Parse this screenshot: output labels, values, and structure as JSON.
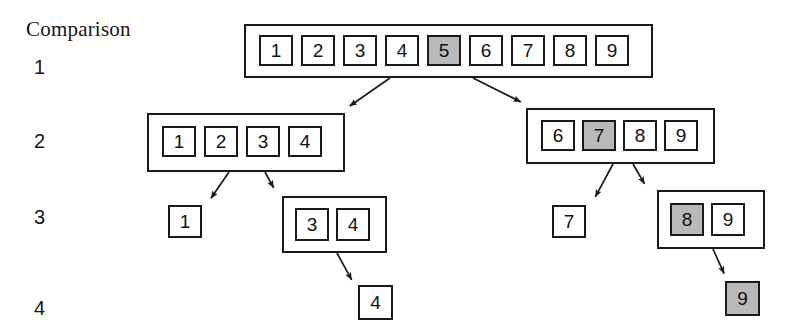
{
  "diagram": {
    "title": "Comparison",
    "kind": "binary-search-recursion-tree",
    "highlight_color": "#b9b9b9",
    "line_color": "#1a1a1a",
    "background_color": "#ffffff",
    "row_labels": [
      {
        "text": "1",
        "x": 34,
        "y": 56
      },
      {
        "text": "2",
        "x": 34,
        "y": 130
      },
      {
        "text": "3",
        "x": 34,
        "y": 206
      },
      {
        "text": "4",
        "x": 34,
        "y": 297
      }
    ],
    "groups": [
      {
        "id": "root",
        "comparison": 1,
        "boxed": true,
        "box": {
          "x": 244,
          "y": 24,
          "w": 409,
          "h": 54
        },
        "cell_size": {
          "w": 34,
          "h": 31
        },
        "cell_gap": 8,
        "cells_origin": {
          "x": 259,
          "y": 35
        },
        "cells": [
          {
            "value": "1",
            "highlighted": false
          },
          {
            "value": "2",
            "highlighted": false
          },
          {
            "value": "3",
            "highlighted": false
          },
          {
            "value": "4",
            "highlighted": false
          },
          {
            "value": "5",
            "highlighted": true
          },
          {
            "value": "6",
            "highlighted": false
          },
          {
            "value": "7",
            "highlighted": false
          },
          {
            "value": "8",
            "highlighted": false
          },
          {
            "value": "9",
            "highlighted": false
          }
        ]
      },
      {
        "id": "left-2",
        "comparison": 2,
        "boxed": true,
        "box": {
          "x": 147,
          "y": 113,
          "w": 198,
          "h": 59
        },
        "cell_size": {
          "w": 34,
          "h": 31
        },
        "cell_gap": 8,
        "cells_origin": {
          "x": 162,
          "y": 126
        },
        "cells": [
          {
            "value": "1",
            "highlighted": false
          },
          {
            "value": "2",
            "highlighted": false
          },
          {
            "value": "3",
            "highlighted": false
          },
          {
            "value": "4",
            "highlighted": false
          }
        ]
      },
      {
        "id": "right-2",
        "comparison": 2,
        "boxed": true,
        "box": {
          "x": 526,
          "y": 108,
          "w": 189,
          "h": 56
        },
        "cell_size": {
          "w": 34,
          "h": 31
        },
        "cell_gap": 7,
        "cells_origin": {
          "x": 541,
          "y": 120
        },
        "cells": [
          {
            "value": "6",
            "highlighted": false
          },
          {
            "value": "7",
            "highlighted": true
          },
          {
            "value": "8",
            "highlighted": false
          },
          {
            "value": "9",
            "highlighted": false
          }
        ]
      },
      {
        "id": "left-3-a",
        "comparison": 3,
        "boxed": false,
        "cell_size": {
          "w": 34,
          "h": 33
        },
        "cell_gap": 8,
        "cells_origin": {
          "x": 168,
          "y": 205
        },
        "cells": [
          {
            "value": "1",
            "highlighted": false
          }
        ]
      },
      {
        "id": "left-3-b",
        "comparison": 3,
        "boxed": true,
        "box": {
          "x": 282,
          "y": 196,
          "w": 105,
          "h": 57
        },
        "cell_size": {
          "w": 34,
          "h": 33
        },
        "cell_gap": 7,
        "cells_origin": {
          "x": 295,
          "y": 208
        },
        "cells": [
          {
            "value": "3",
            "highlighted": false
          },
          {
            "value": "4",
            "highlighted": false
          }
        ]
      },
      {
        "id": "right-3-a",
        "comparison": 3,
        "boxed": false,
        "cell_size": {
          "w": 34,
          "h": 33
        },
        "cell_gap": 8,
        "cells_origin": {
          "x": 552,
          "y": 205
        },
        "cells": [
          {
            "value": "7",
            "highlighted": false
          }
        ]
      },
      {
        "id": "right-3-b",
        "comparison": 3,
        "boxed": true,
        "box": {
          "x": 657,
          "y": 190,
          "w": 108,
          "h": 59
        },
        "cell_size": {
          "w": 34,
          "h": 33
        },
        "cell_gap": 7,
        "cells_origin": {
          "x": 670,
          "y": 203
        },
        "cells": [
          {
            "value": "8",
            "highlighted": true
          },
          {
            "value": "9",
            "highlighted": false
          }
        ]
      },
      {
        "id": "left-4",
        "comparison": 4,
        "boxed": false,
        "cell_size": {
          "w": 35,
          "h": 35
        },
        "cell_gap": 8,
        "cells_origin": {
          "x": 358,
          "y": 285
        },
        "cells": [
          {
            "value": "4",
            "highlighted": false
          }
        ]
      },
      {
        "id": "right-4",
        "comparison": 4,
        "boxed": false,
        "cell_size": {
          "w": 35,
          "h": 35
        },
        "cell_gap": 8,
        "cells_origin": {
          "x": 725,
          "y": 281
        },
        "cells": [
          {
            "value": "9",
            "highlighted": true
          }
        ]
      }
    ],
    "arrows": [
      {
        "id": "root-to-left2",
        "x1": 390,
        "y1": 78,
        "x2": 344,
        "y2": 110
      },
      {
        "id": "root-to-right2",
        "x1": 473,
        "y1": 78,
        "x2": 527,
        "y2": 105
      },
      {
        "id": "left2-to-1",
        "x1": 229,
        "y1": 172,
        "x2": 207,
        "y2": 204
      },
      {
        "id": "left2-to-34",
        "x1": 265,
        "y1": 172,
        "x2": 277,
        "y2": 194
      },
      {
        "id": "right2-to-7",
        "x1": 613,
        "y1": 164,
        "x2": 592,
        "y2": 203
      },
      {
        "id": "right2-to-89",
        "x1": 633,
        "y1": 164,
        "x2": 648,
        "y2": 190
      },
      {
        "id": "box34-to-4",
        "x1": 337,
        "y1": 253,
        "x2": 355,
        "y2": 286
      },
      {
        "id": "box89-to-9",
        "x1": 713,
        "y1": 249,
        "x2": 727,
        "y2": 280
      }
    ]
  }
}
